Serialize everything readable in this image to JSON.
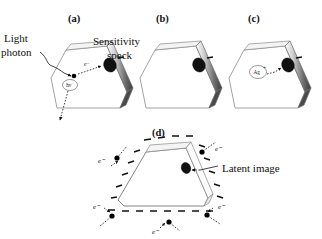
{
  "figure": {
    "background_color": "#ffffff",
    "ink_color": "#111111",
    "width": 322,
    "height": 239
  },
  "panels": [
    {
      "id": "a",
      "label": "(a)",
      "label_x": 68,
      "label_y": 22,
      "description": "Light photon absorbed by crystal liberates an electron that migrates to the sensitivity speck",
      "annotations": [
        {
          "name": "light-photon-label",
          "text": "Light",
          "x": 4,
          "y": 40
        },
        {
          "name": "light-photon-label-line2",
          "text": "photon",
          "x": 1,
          "y": 54
        },
        {
          "name": "sensitivity-speck-label",
          "text": "Sensitivity",
          "x": 93,
          "y": 45
        },
        {
          "name": "sensitivity-speck-label-line2",
          "text": "speck",
          "x": 106,
          "y": 59
        }
      ],
      "species": [
        {
          "name": "photon-symbol",
          "text": "hv",
          "x": 66,
          "y": 83,
          "circled": true
        },
        {
          "name": "electron-symbol",
          "text": "e⁻",
          "x": 78,
          "y": 70
        }
      ]
    },
    {
      "id": "b",
      "label": "(b)",
      "label_x": 156,
      "label_y": 22,
      "description": "Electron trapped at the sensitivity speck giving it a negative charge",
      "annotations": [],
      "species": []
    },
    {
      "id": "c",
      "label": "(c)",
      "label_x": 248,
      "label_y": 22,
      "description": "Interstitial silver ion attracted to the negatively charged speck",
      "annotations": [],
      "species": [
        {
          "name": "silver-ion-symbol",
          "text": "Ag",
          "superscript": "+",
          "x": 253,
          "y": 70,
          "circled": true
        }
      ]
    },
    {
      "id": "d",
      "label": "(d)",
      "label_x": 152,
      "label_y": 136,
      "description": "Repeated trapping builds a silver cluster, the latent image, with surrounding electrons and negative surface charge",
      "annotations": [
        {
          "name": "latent-image-label",
          "text": "Latent image",
          "x": 222,
          "y": 170
        }
      ],
      "species": [
        {
          "name": "electron-symbol-left-upper",
          "text": "e⁻",
          "x": 100,
          "y": 160
        },
        {
          "name": "electron-symbol-right-upper",
          "text": "e⁻",
          "x": 218,
          "y": 155
        },
        {
          "name": "electron-symbol-left-lower",
          "text": "e⁻",
          "x": 95,
          "y": 208
        },
        {
          "name": "electron-symbol-right-lower",
          "text": "e⁻",
          "x": 218,
          "y": 208
        },
        {
          "name": "electron-symbol-bottom",
          "text": "e⁻",
          "x": 155,
          "y": 232
        }
      ]
    }
  ],
  "legend_terms": {
    "light_photon": "Light photon",
    "sensitivity_speck": "Sensitivity speck",
    "latent_image": "Latent image",
    "electron": "e⁻",
    "photon": "hv",
    "silver_ion": "Ag+"
  }
}
